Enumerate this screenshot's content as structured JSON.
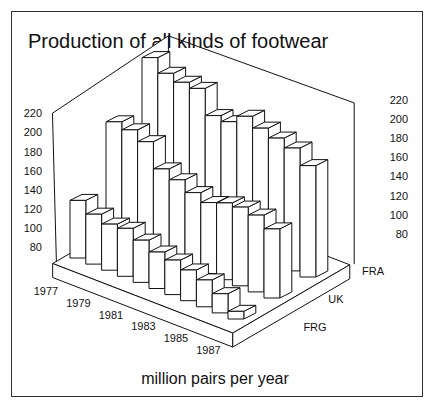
{
  "chart_data": {
    "type": "bar",
    "subtype": "3d-bar",
    "title": "Production of all kinds of footwear",
    "xlabel": "million pairs per year",
    "ylabel": "",
    "categories": [
      "1977",
      "1978",
      "1979",
      "1980",
      "1981",
      "1982",
      "1983",
      "1984",
      "1985",
      "1986",
      "1987"
    ],
    "year_tick_labels": [
      "1977",
      "1979",
      "1981",
      "1983",
      "1985",
      "1987"
    ],
    "depth_labels": [
      "FRA",
      "UK",
      "FRG"
    ],
    "yticks": [
      80,
      100,
      120,
      140,
      160,
      180,
      200,
      220
    ],
    "ylim": [
      60,
      230
    ],
    "grid": false,
    "legend": null,
    "series": [
      {
        "name": "FRG",
        "values": [
          120,
          112,
          108,
          110,
          104,
          98,
          96,
          92,
          88,
          80,
          68
        ]
      },
      {
        "name": "UK",
        "values": [
          180,
          178,
          172,
          150,
          145,
          138,
          134,
          140,
          142,
          140,
          132
        ]
      },
      {
        "name": "FRA",
        "values": [
          225,
          215,
          212,
          212,
          190,
          190,
          202,
          196,
          192,
          188,
          176
        ]
      }
    ]
  },
  "text": {
    "title": "Production of all kinds of footwear",
    "subtitle": "million pairs per year"
  }
}
